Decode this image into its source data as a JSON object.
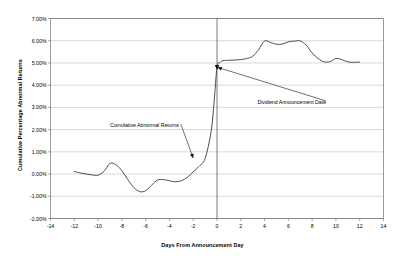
{
  "chart_data": {
    "type": "line",
    "title": "",
    "subtitle": "",
    "xlabel": "Days From Announcement Day",
    "ylabel": "Cumulative Percentage Abnormal Returns",
    "xlim": [
      -14,
      14
    ],
    "ylim": [
      -2.0,
      7.0
    ],
    "x_ticks": [
      "-14",
      "-12",
      "-10",
      "-8",
      "-6",
      "-4",
      "-2",
      "0",
      "2",
      "4",
      "6",
      "8",
      "10",
      "12",
      "14"
    ],
    "y_ticks": [
      "7.00%",
      "6.00%",
      "5.00%",
      "4.00%",
      "3.00%",
      "2.00%",
      "1.00%",
      "0.00%",
      "-1.00%",
      "-2.00%"
    ],
    "x_tick_values": [
      -14,
      -12,
      -10,
      -8,
      -6,
      -4,
      -2,
      0,
      2,
      4,
      6,
      8,
      10,
      12,
      14
    ],
    "y_tick_values": [
      7.0,
      6.0,
      5.0,
      4.0,
      3.0,
      2.0,
      1.0,
      0.0,
      -1.0,
      -2.0
    ],
    "grid": "horizontal",
    "legend": "none",
    "series": [
      {
        "name": "Cumulative Abnormal Returns",
        "x": [
          -12.0,
          -11.5,
          -11.0,
          -10.5,
          -10.0,
          -9.5,
          -9.0,
          -8.5,
          -8.0,
          -7.5,
          -7.0,
          -6.5,
          -6.0,
          -5.5,
          -5.0,
          -4.5,
          -4.0,
          -3.5,
          -3.0,
          -2.5,
          -2.0,
          -1.5,
          -1.0,
          -0.5,
          -0.25,
          0.0,
          0.25,
          0.5,
          1.0,
          1.5,
          2.0,
          2.5,
          3.0,
          3.5,
          4.0,
          4.5,
          5.0,
          5.5,
          6.0,
          6.5,
          7.0,
          7.5,
          8.0,
          8.5,
          9.0,
          9.5,
          10.0,
          10.5,
          11.0,
          11.5,
          12.0
        ],
        "values": [
          0.12,
          0.05,
          0.0,
          -0.04,
          -0.05,
          0.12,
          0.48,
          0.42,
          0.15,
          -0.25,
          -0.6,
          -0.79,
          -0.75,
          -0.5,
          -0.27,
          -0.25,
          -0.3,
          -0.35,
          -0.3,
          -0.15,
          0.1,
          0.35,
          0.7,
          1.9,
          3.2,
          4.8,
          5.02,
          5.1,
          5.12,
          5.13,
          5.15,
          5.2,
          5.3,
          5.6,
          5.99,
          5.92,
          5.84,
          5.85,
          5.95,
          5.98,
          5.99,
          5.8,
          5.45,
          5.2,
          5.05,
          5.06,
          5.2,
          5.15,
          5.05,
          5.03,
          5.04
        ]
      }
    ],
    "annotations": [
      {
        "name": "cumulative-abnormal-returns",
        "text": "Cumulative Abnormal Returns",
        "text_x": -9.0,
        "text_y": 2.2,
        "arrow_to_x": -2.0,
        "arrow_to_y": 0.72
      },
      {
        "name": "dividend-announcement-date",
        "text": "Dividend Announcement Date",
        "text_x": 3.4,
        "text_y": 3.25,
        "arrow_to_x": 0.05,
        "arrow_to_y": 4.8
      }
    ],
    "markers": [
      {
        "name": "announcement-day-marker",
        "x": 0.0,
        "y": 4.8,
        "shape": "triangle"
      }
    ],
    "vertical_reference_line": {
      "name": "announcement-day-line",
      "x": 0.0,
      "color": "#555555"
    },
    "colors": {
      "line": "#4d4d4d",
      "grid": "#c8c8c8",
      "axis": "#808080",
      "text": "#000000",
      "background": "#ffffff"
    }
  }
}
